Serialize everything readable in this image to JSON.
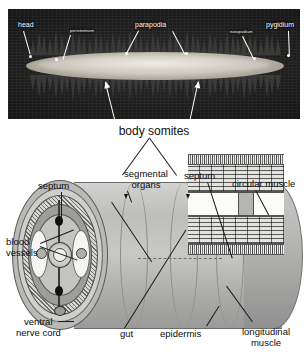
{
  "photo": {
    "caption": "body somites",
    "labels": [
      {
        "id": "head",
        "text": "head"
      },
      {
        "id": "peristomium",
        "text": "peristomium"
      },
      {
        "id": "parapodia",
        "text": "parapodia"
      },
      {
        "id": "notopodium",
        "text": "notopodium"
      },
      {
        "id": "pygidium",
        "text": "pygidium"
      }
    ]
  },
  "diagram": {
    "labels": [
      {
        "id": "septum-left",
        "text": "septum"
      },
      {
        "id": "segmental-organs-1",
        "text": "segmental"
      },
      {
        "id": "segmental-organs-2",
        "text": "organs"
      },
      {
        "id": "septum-right",
        "text": "septum"
      },
      {
        "id": "circular-muscle",
        "text": "circular muscle"
      },
      {
        "id": "blood-vessels-1",
        "text": "blood"
      },
      {
        "id": "blood-vessels-2",
        "text": "vessels"
      },
      {
        "id": "ventral-nerve-cord-1",
        "text": "ventral"
      },
      {
        "id": "ventral-nerve-cord-2",
        "text": "nerve cord"
      },
      {
        "id": "gut",
        "text": "gut"
      },
      {
        "id": "epidermis",
        "text": "epidermis"
      },
      {
        "id": "longitudinal-muscle-1",
        "text": "longitudinal"
      },
      {
        "id": "longitudinal-muscle-2",
        "text": "muscle"
      }
    ]
  },
  "colors": {
    "photo_background": "#0d0d0d",
    "label_light": "#ffffff",
    "label_dark": "#0d0d0d",
    "diagram_body": "#bdbdbb"
  }
}
